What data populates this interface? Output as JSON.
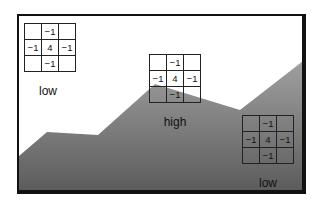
{
  "diagram": {
    "terrain_fill_colors": [
      "#9a9a9a",
      "#5a5a5a"
    ],
    "frame_color": "#111111",
    "kernels": [
      {
        "id": "kernel-top-left",
        "label": "low",
        "cells": [
          [
            "",
            "−1",
            ""
          ],
          [
            "−1",
            "4",
            "−1"
          ],
          [
            "",
            "−1",
            ""
          ]
        ]
      },
      {
        "id": "kernel-middle",
        "label": "high",
        "cells": [
          [
            "",
            "−1",
            ""
          ],
          [
            "−1",
            "4",
            "−1"
          ],
          [
            "",
            "−1",
            ""
          ]
        ]
      },
      {
        "id": "kernel-bottom-right",
        "label": "low",
        "cells": [
          [
            "",
            "−1",
            ""
          ],
          [
            "−1",
            "4",
            "−1"
          ],
          [
            "",
            "−1",
            ""
          ]
        ]
      }
    ]
  }
}
